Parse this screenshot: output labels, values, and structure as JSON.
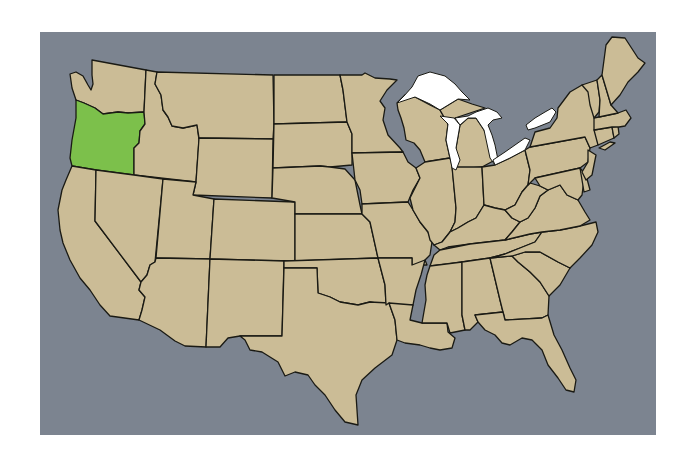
{
  "map": {
    "title": "United States - Oregon highlighted",
    "highlighted_state": "Oregon",
    "colors": {
      "water": "#7c8490",
      "land": "#cbbc96",
      "highlight": "#7cc04b",
      "lakes": "#ffffff",
      "border": "#1a1a14"
    },
    "states": [
      "Washington",
      "Oregon",
      "California",
      "Idaho",
      "Nevada",
      "Montana",
      "Wyoming",
      "Utah",
      "Arizona",
      "Colorado",
      "New Mexico",
      "North Dakota",
      "South Dakota",
      "Nebraska",
      "Kansas",
      "Oklahoma",
      "Texas",
      "Minnesota",
      "Iowa",
      "Missouri",
      "Arkansas",
      "Louisiana",
      "Wisconsin",
      "Illinois",
      "Michigan",
      "Indiana",
      "Ohio",
      "Kentucky",
      "Tennessee",
      "Mississippi",
      "Alabama",
      "Georgia",
      "Florida",
      "South Carolina",
      "North Carolina",
      "Virginia",
      "West Virginia",
      "Pennsylvania",
      "New York",
      "Maryland",
      "Delaware",
      "New Jersey",
      "Connecticut",
      "Rhode Island",
      "Massachusetts",
      "Vermont",
      "New Hampshire",
      "Maine"
    ],
    "lakes": [
      "Lake Superior",
      "Lake Michigan",
      "Lake Huron",
      "Lake Erie",
      "Lake Ontario"
    ]
  }
}
